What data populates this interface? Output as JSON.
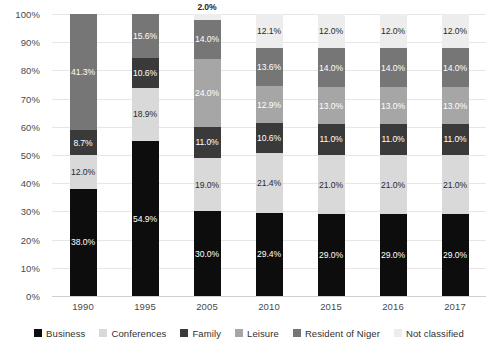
{
  "chart_data": {
    "type": "bar",
    "stacked": true,
    "title": "",
    "xlabel": "",
    "ylabel": "",
    "ylim": [
      0,
      100
    ],
    "grid": true,
    "legend_position": "bottom",
    "categories": [
      "1990",
      "1995",
      "2005",
      "2010",
      "2015",
      "2016",
      "2017"
    ],
    "ytick_labels": [
      "0%",
      "10%",
      "20%",
      "30%",
      "40%",
      "50%",
      "60%",
      "70%",
      "80%",
      "90%",
      "100%"
    ],
    "ytick_values": [
      0,
      10,
      20,
      30,
      40,
      50,
      60,
      70,
      80,
      90,
      100
    ],
    "series": [
      {
        "name": "Business",
        "color": "#0d0d0d",
        "values": [
          38.0,
          54.9,
          30.0,
          29.4,
          29.0,
          29.0,
          29.0
        ],
        "labels": [
          "38.0%",
          "54.9%",
          "30.0%",
          "29.4%",
          "29.0%",
          "29.0%",
          "29.0%"
        ]
      },
      {
        "name": "Conferences",
        "color": "#d9d9d9",
        "values": [
          12.0,
          18.9,
          19.0,
          21.4,
          21.0,
          21.0,
          21.0
        ],
        "labels": [
          "12.0%",
          "18.9%",
          "19.0%",
          "21.4%",
          "21.0%",
          "21.0%",
          "21.0%"
        ]
      },
      {
        "name": "Family",
        "color": "#3a3a3a",
        "values": [
          8.7,
          10.6,
          11.0,
          10.6,
          11.0,
          11.0,
          11.0
        ],
        "labels": [
          "8.7%",
          "10.6%",
          "11.0%",
          "10.6%",
          "11.0%",
          "11.0%",
          "11.0%"
        ]
      },
      {
        "name": "Leisure",
        "color": "#a6a6a6",
        "values": [
          0,
          0,
          24.0,
          12.9,
          13.0,
          13.0,
          13.0
        ],
        "labels": [
          "",
          "",
          "24.0%",
          "12.9%",
          "13.0%",
          "13.0%",
          "13.0%"
        ]
      },
      {
        "name": "Resident of Niger",
        "color": "#767676",
        "values": [
          41.3,
          15.6,
          14.0,
          13.6,
          14.0,
          14.0,
          14.0
        ],
        "labels": [
          "41.3%",
          "15.6%",
          "14.0%",
          "13.6%",
          "14.0%",
          "14.0%",
          "14.0%"
        ]
      },
      {
        "name": "Not classified",
        "color": "#ededed",
        "values": [
          0,
          0,
          2.0,
          12.1,
          12.0,
          12.0,
          12.0
        ],
        "labels": [
          "",
          "",
          "2.0%",
          "12.1%",
          "12.0%",
          "12.0%",
          "12.0%"
        ]
      }
    ]
  },
  "legend": {
    "items": [
      {
        "label": "Business",
        "color": "#0d0d0d"
      },
      {
        "label": "Conferences",
        "color": "#d9d9d9"
      },
      {
        "label": "Family",
        "color": "#3a3a3a"
      },
      {
        "label": "Leisure",
        "color": "#a6a6a6"
      },
      {
        "label": "Resident of Niger",
        "color": "#767676"
      },
      {
        "label": "Not classified",
        "color": "#ededed"
      }
    ]
  }
}
